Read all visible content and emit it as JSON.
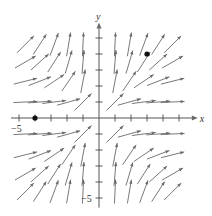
{
  "figure": {
    "type": "slope_field",
    "colors": {
      "axis": "#555555",
      "arrow": "#6a6a6a",
      "dot": "#111111",
      "background": "#ffffff"
    },
    "axes": {
      "x_label": "x",
      "y_label": "y",
      "x_tick_label": "−5",
      "y_tick_label": "−5",
      "x_range": [
        -5,
        5
      ],
      "y_range": [
        -5,
        5
      ],
      "ticks": [
        -5,
        -4,
        -3,
        -2,
        -1,
        1,
        2,
        3,
        4,
        5
      ]
    },
    "points": [
      {
        "x": -4,
        "y": 0
      },
      {
        "x": 3,
        "y": 4
      }
    ],
    "arrow_grid": {
      "x_values": [
        -4.6,
        -3.7,
        -2.8,
        -1.9,
        -1.0,
        1.0,
        1.9,
        2.8,
        3.7,
        4.6
      ],
      "y_values": [
        4.6,
        3.5,
        2.3,
        1.0,
        -1.0,
        -2.3,
        -3.5,
        -4.6
      ],
      "slope_rule": "y^2 / x^2",
      "length_px": 24
    }
  },
  "layout": {
    "origin_px": [
      99,
      118
    ],
    "unit_px": 16
  }
}
